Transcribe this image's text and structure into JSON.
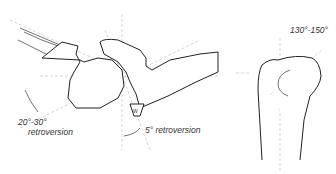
{
  "figure": {
    "left_view": {
      "angle_label_1": "20°-30°",
      "angle_label_2": "retroversion",
      "angle_label_3": "5° retroversion"
    },
    "right_view": {
      "angle_label": "130°-150°"
    }
  }
}
